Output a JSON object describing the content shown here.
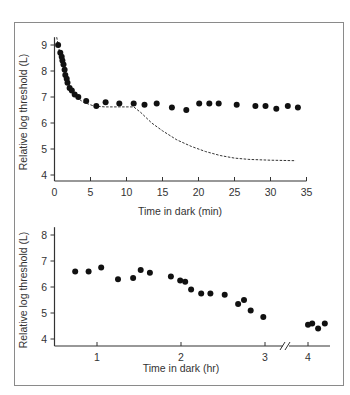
{
  "chart_data": [
    {
      "type": "scatter",
      "title": "",
      "xlabel": "Time in dark (min)",
      "ylabel": "Relative log threshold (L)",
      "xlim": [
        0,
        35
      ],
      "ylim": [
        3.7,
        9.3
      ],
      "xticks": [
        0,
        5,
        10,
        15,
        20,
        25,
        30,
        35
      ],
      "yticks": [
        4,
        5,
        6,
        7,
        8,
        9
      ],
      "grid": false,
      "legend": null,
      "series": [
        {
          "name": "Measured threshold",
          "style": "filled-circle",
          "x": [
            0.5,
            0.8,
            1.0,
            1.1,
            1.25,
            1.4,
            1.5,
            1.7,
            1.8,
            2.1,
            2.4,
            2.8,
            3.3,
            4.4,
            5.8,
            7.1,
            9.0,
            11.0,
            12.5,
            14.2,
            16.3,
            18.3,
            20.1,
            21.5,
            22.8,
            25.3,
            27.9,
            29.3,
            30.8,
            32.4,
            33.8
          ],
          "y": [
            9.0,
            8.7,
            8.55,
            8.4,
            8.25,
            8.05,
            7.85,
            7.7,
            7.55,
            7.35,
            7.25,
            7.1,
            7.0,
            6.85,
            6.65,
            6.8,
            6.75,
            6.75,
            6.7,
            6.75,
            6.6,
            6.5,
            6.75,
            6.75,
            6.75,
            6.7,
            6.65,
            6.65,
            6.55,
            6.65,
            6.6
          ]
        },
        {
          "name": "Cone curve + rod curve (dashed)",
          "style": "dashed-line",
          "x": [
            0.3,
            0.8,
            1.5,
            2.2,
            3.0,
            4.0,
            5.5,
            7.0,
            9.0,
            11.0,
            12.0,
            13.5,
            15.0,
            17.0,
            19.0,
            21.0,
            23.0,
            25.0,
            27.0,
            30.0,
            33.5
          ],
          "y": [
            9.3,
            8.6,
            7.8,
            7.3,
            7.0,
            6.8,
            6.65,
            6.62,
            6.62,
            6.62,
            6.4,
            6.0,
            5.7,
            5.35,
            5.1,
            4.9,
            4.75,
            4.65,
            4.6,
            4.57,
            4.55
          ]
        }
      ]
    },
    {
      "type": "scatter",
      "title": "",
      "xlabel": "Time in dark (hr)",
      "ylabel": "Relative log threshold (L)",
      "xlim": [
        0.5,
        4.25
      ],
      "ylim": [
        3.7,
        8.3
      ],
      "xticks": [
        1,
        2,
        3,
        4
      ],
      "yticks": [
        4,
        5,
        6,
        7,
        8
      ],
      "axis_break": "between 3 and 4 hr",
      "grid": false,
      "legend": null,
      "series": [
        {
          "name": "Measured threshold",
          "style": "filled-circle",
          "x": [
            0.74,
            0.9,
            1.05,
            1.25,
            1.43,
            1.52,
            1.63,
            1.88,
            1.99,
            2.05,
            2.12,
            2.24,
            2.35,
            2.52,
            2.68,
            2.75,
            2.83,
            2.98,
            4.0,
            4.05,
            4.12,
            4.2
          ],
          "y": [
            6.6,
            6.6,
            6.75,
            6.3,
            6.35,
            6.65,
            6.55,
            6.4,
            6.25,
            6.2,
            5.9,
            5.75,
            5.75,
            5.7,
            5.35,
            5.5,
            5.1,
            4.85,
            4.55,
            4.6,
            4.4,
            4.6
          ]
        }
      ]
    }
  ],
  "labels": {
    "top_xlabel": "Time in dark (min)",
    "top_ylabel": "Relative log threshold (L)",
    "bottom_xlabel": "Time in dark (hr)",
    "bottom_ylabel": "Relative log threshold (L)",
    "top_xticks": [
      "0",
      "5",
      "10",
      "15",
      "20",
      "25",
      "30",
      "35"
    ],
    "top_yticks": [
      "4",
      "5",
      "6",
      "7",
      "8",
      "9"
    ],
    "bottom_xticks": [
      "1",
      "2",
      "3",
      "4"
    ],
    "bottom_yticks": [
      "4",
      "5",
      "6",
      "7",
      "8"
    ],
    "break_mark": "//"
  },
  "colors": {
    "frame": "#8a8a8a",
    "axis": "#333333",
    "points": "#111111",
    "dashed": "#333333"
  }
}
